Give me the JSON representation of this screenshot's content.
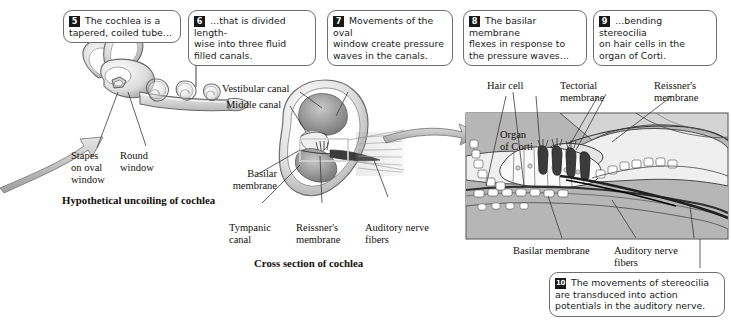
{
  "figure": {
    "width": 731,
    "height": 325,
    "background": "#ffffff",
    "ink_color": "#15100c",
    "badge_color": "#171717",
    "balloon_border": "#6e6e6e"
  },
  "callouts": [
    {
      "id": "callout-5",
      "number": "5",
      "text": "The cochlea is a\ntapered, coiled tube…"
    },
    {
      "id": "callout-6",
      "number": "6",
      "text": "…that is divided length-\nwise into three fluid\nfilled canals."
    },
    {
      "id": "callout-7",
      "number": "7",
      "text": "Movements of the oval\nwindow create pressure\nwaves in the canals."
    },
    {
      "id": "callout-8",
      "number": "8",
      "text": "The basilar membrane\nflexes in response to\nthe pressure waves…"
    },
    {
      "id": "callout-9",
      "number": "9",
      "text": "…bending stereocilia\non hair cells in the\norgan of Corti."
    },
    {
      "id": "callout-10",
      "number": "10",
      "text": "The movements of stereocilia\nare transduced into action\npotentials in the auditory nerve."
    }
  ],
  "labels": {
    "stapes_on_oval_window": "Stapes\non oval\nwindow",
    "round_window": "Round\nwindow",
    "vestibular_canal": "Vestibular canal",
    "middle_canal": "Middle canal",
    "basilar_membrane_mid": "Basilar\nmembrane",
    "tympanic_canal": "Tympanic\ncanal",
    "reissners_membrane_mid": "Reissner's\nmembrane",
    "auditory_nerve_fibers_mid": "Auditory nerve\nfibers",
    "hair_cell": "Hair cell",
    "tectorial_membrane": "Tectorial\nmembrane",
    "reissners_membrane_right": "Reissner's\nmembrane",
    "organ_of_corti": "Organ\nof Corti",
    "basilar_membrane_right": "Basilar membrane",
    "auditory_nerve_fibers_right": "Auditory nerve\nfibers"
  },
  "captions": {
    "left_panel": "Hypothetical uncoiling of cochlea",
    "middle_panel": "Cross section of cochlea"
  },
  "icons": {
    "flow_arrow_left": "flow-arrow-icon",
    "flow_arrow_right": "flow-arrow-icon",
    "detail_frame": "detail-frame-icon"
  }
}
